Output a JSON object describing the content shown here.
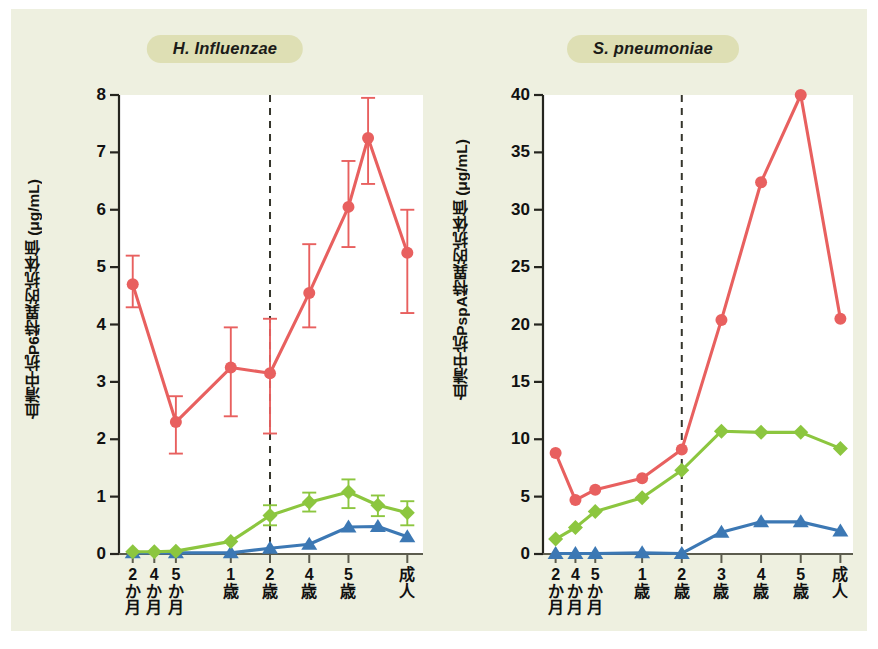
{
  "figure": {
    "background_color": "#eef0e0",
    "plot_background_color": "#ffffff",
    "series_colors": {
      "red": "#e8605f",
      "green": "#8cc63f",
      "blue": "#3c78b4"
    }
  },
  "panels": [
    {
      "id": "h-influenzae",
      "title": "H. Influenzae"
    },
    {
      "id": "s-pneumoniae",
      "title": "S. pneumoniae"
    }
  ],
  "chart_data": [
    {
      "type": "line",
      "title": "H. Influenzae",
      "xlabel": "",
      "ylabel": "血清中抗P6特異的抗体価 (μg/mL)",
      "ylim": [
        0,
        8
      ],
      "yticks": [
        0,
        1,
        2,
        3,
        4,
        5,
        6,
        7,
        8
      ],
      "ytick_labels": [
        "0",
        "1",
        "2",
        "3",
        "4",
        "5",
        "6",
        "7",
        "8"
      ],
      "grid": false,
      "legend": "none",
      "categories": [
        "2かか月",
        "4か月",
        "5か月",
        "1歳",
        "2歳",
        "4歳",
        "5歳",
        "成人"
      ],
      "category_labels": [
        [
          "2",
          "か",
          "月"
        ],
        [
          "4",
          "か",
          "月"
        ],
        [
          "5",
          "か",
          "月"
        ],
        [
          "1",
          "歳",
          ""
        ],
        [
          "2",
          "歳",
          ""
        ],
        [
          "4",
          "歳",
          ""
        ],
        [
          "5",
          "歳",
          ""
        ],
        [
          "成",
          "人",
          ""
        ]
      ],
      "x_positions": [
        0.0,
        0.55,
        1.1,
        2.5,
        3.5,
        4.5,
        5.5,
        7.0
      ],
      "x_axis_range": [
        -0.35,
        7.4
      ],
      "annotations": [
        {
          "type": "vertical-dashed-line",
          "x": 3.5,
          "label": "2歳"
        }
      ],
      "series": [
        {
          "name": "抗P6 IgG (赤)",
          "color": "#e8605f",
          "marker": "circle",
          "x": [
            0.0,
            1.1,
            2.5,
            3.5,
            4.5,
            5.5,
            7.0
          ],
          "values": [
            4.7,
            2.3,
            3.25,
            3.15,
            4.55,
            6.05,
            7.25,
            5.25
          ],
          "points": [
            {
              "x": 0.0,
              "y": 4.7,
              "err_lo": 4.3,
              "err_hi": 5.2
            },
            {
              "x": 1.1,
              "y": 2.3,
              "err_lo": 1.75,
              "err_hi": 2.75
            },
            {
              "x": 2.5,
              "y": 3.25,
              "err_lo": 2.4,
              "err_hi": 3.95
            },
            {
              "x": 3.5,
              "y": 3.15,
              "err_lo": 2.1,
              "err_hi": 4.1
            },
            {
              "x": 4.5,
              "y": 4.55,
              "err_lo": 3.95,
              "err_hi": 5.4
            },
            {
              "x": 5.5,
              "y": 6.05,
              "err_lo": 5.35,
              "err_hi": 6.85
            },
            {
              "x": 6.0,
              "y": 7.25,
              "err_lo": 6.45,
              "err_hi": 7.95
            },
            {
              "x": 7.0,
              "y": 5.25,
              "err_lo": 4.2,
              "err_hi": 6.0
            }
          ]
        },
        {
          "name": "抗P6 IgA (緑)",
          "color": "#8cc63f",
          "marker": "diamond",
          "points": [
            {
              "x": 0.0,
              "y": 0.04,
              "err_lo": 0.04,
              "err_hi": 0.04
            },
            {
              "x": 0.55,
              "y": 0.04,
              "err_lo": 0.04,
              "err_hi": 0.04
            },
            {
              "x": 1.1,
              "y": 0.05,
              "err_lo": 0.05,
              "err_hi": 0.05
            },
            {
              "x": 2.5,
              "y": 0.22,
              "err_lo": 0.22,
              "err_hi": 0.22
            },
            {
              "x": 3.5,
              "y": 0.67,
              "err_lo": 0.5,
              "err_hi": 0.85
            },
            {
              "x": 4.5,
              "y": 0.9,
              "err_lo": 0.74,
              "err_hi": 1.07
            },
            {
              "x": 5.5,
              "y": 1.08,
              "err_lo": 0.8,
              "err_hi": 1.3
            },
            {
              "x": 6.25,
              "y": 0.85,
              "err_lo": 0.66,
              "err_hi": 1.02
            },
            {
              "x": 7.0,
              "y": 0.72,
              "err_lo": 0.5,
              "err_hi": 0.92
            }
          ]
        },
        {
          "name": "抗P6 分泌型IgA (青)",
          "color": "#3c78b4",
          "marker": "triangle",
          "points": [
            {
              "x": 0.0,
              "y": 0.02
            },
            {
              "x": 1.1,
              "y": 0.02
            },
            {
              "x": 2.5,
              "y": 0.02
            },
            {
              "x": 3.5,
              "y": 0.1
            },
            {
              "x": 4.5,
              "y": 0.17
            },
            {
              "x": 5.5,
              "y": 0.47
            },
            {
              "x": 6.25,
              "y": 0.48
            },
            {
              "x": 7.0,
              "y": 0.3
            }
          ]
        }
      ]
    },
    {
      "type": "line",
      "title": "S. pneumoniae",
      "xlabel": "",
      "ylabel": "血清中抗PspA特異的抗体価 (μg/mL)",
      "ylim": [
        0,
        40
      ],
      "yticks": [
        0,
        5,
        10,
        15,
        20,
        25,
        30,
        35,
        40
      ],
      "ytick_labels": [
        "0",
        "5",
        "10",
        "15",
        "20",
        "25",
        "30",
        "35",
        "40"
      ],
      "grid": false,
      "legend": "none",
      "categories": [
        "2か月",
        "4か月",
        "5か月",
        "1歳",
        "2歳",
        "3歳",
        "4歳",
        "5歳",
        "成人"
      ],
      "category_labels": [
        [
          "2",
          "か",
          "月"
        ],
        [
          "4",
          "か",
          "月"
        ],
        [
          "5",
          "か",
          "月"
        ],
        [
          "1",
          "歳",
          ""
        ],
        [
          "2",
          "歳",
          ""
        ],
        [
          "3",
          "歳",
          ""
        ],
        [
          "4",
          "歳",
          ""
        ],
        [
          "5",
          "歳",
          ""
        ],
        [
          "成",
          "人",
          ""
        ]
      ],
      "x_positions": [
        0.0,
        0.55,
        1.1,
        2.4,
        3.5,
        4.6,
        5.7,
        6.8,
        7.9
      ],
      "x_axis_range": [
        -0.35,
        8.25
      ],
      "annotations": [
        {
          "type": "vertical-dashed-line",
          "x": 3.5,
          "label": "2歳"
        }
      ],
      "series": [
        {
          "name": "抗PspA IgG (赤)",
          "color": "#e8605f",
          "marker": "circle",
          "values": [
            8.8,
            4.7,
            5.6,
            6.6,
            9.1,
            20.4,
            32.4,
            40.0,
            20.5
          ]
        },
        {
          "name": "抗PspA IgA (緑)",
          "color": "#8cc63f",
          "marker": "diamond",
          "values": [
            1.3,
            2.3,
            3.7,
            4.9,
            7.3,
            10.7,
            10.6,
            10.6,
            9.2
          ]
        },
        {
          "name": "抗PspA 分泌型IgA (青)",
          "color": "#3c78b4",
          "marker": "triangle",
          "values": [
            0.05,
            0.05,
            0.05,
            0.1,
            0.05,
            1.9,
            2.8,
            2.8,
            2.0
          ]
        }
      ]
    }
  ]
}
